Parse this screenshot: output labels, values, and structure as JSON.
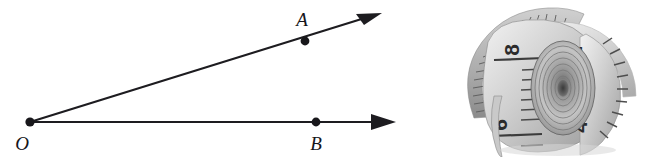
{
  "figure": {
    "kind": "angle-diagram",
    "background_color": "#ffffff",
    "line_color": "#1d1c20",
    "label_color": "#16151a",
    "vertex": {
      "name": "O",
      "label": "O",
      "x": 30,
      "y": 122,
      "label_x": 22,
      "label_y": 150
    },
    "points": [
      {
        "name": "A",
        "label": "A",
        "x": 305,
        "y": 41,
        "label_x": 296,
        "label_y": 26
      },
      {
        "name": "B",
        "label": "B",
        "x": 316,
        "y": 122,
        "label_x": 308,
        "label_y": 150
      }
    ],
    "rays": [
      {
        "name": "ray-OA",
        "from_x": 30,
        "from_y": 122,
        "to_x": 382,
        "to_y": 13,
        "arrowhead": "true",
        "through_point": "A"
      },
      {
        "name": "ray-OB",
        "from_x": 30,
        "from_y": 122,
        "to_x": 396,
        "to_y": 122,
        "arrowhead": "true",
        "through_point": "B"
      }
    ],
    "angle_degrees": 17
  },
  "photo": {
    "kind": "tape-measure-photo",
    "subject": "rolled cloth tape measure",
    "color_mode": "grayscale",
    "visible_numbers": [
      "8",
      "6",
      "2",
      "4"
    ],
    "numbers": [
      {
        "value": "8",
        "x": 79,
        "y": 50,
        "rotation": -90
      },
      {
        "value": "6",
        "x": 67,
        "y": 125,
        "rotation": -90
      },
      {
        "value": "2",
        "x": 142,
        "y": 52,
        "rotation": -90
      },
      {
        "value": "4",
        "x": 147,
        "y": 127,
        "rotation": -90
      }
    ],
    "tape_tone_light": "#e8e8e8",
    "tape_tone_mid": "#bdbdbd",
    "tape_tone_dark": "#8f8f8f",
    "tick_color": "#4a4a4a"
  }
}
